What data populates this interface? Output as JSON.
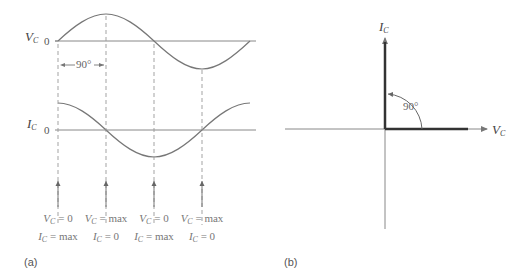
{
  "panel_a": {
    "caption": "(a)",
    "voltage_axis": {
      "symbol": "V",
      "subscript": "C",
      "zero_label": "0"
    },
    "current_axis": {
      "symbol": "I",
      "subscript": "C",
      "zero_label": "0"
    },
    "phase_annotation": "90°",
    "conditions": [
      {
        "v_label": "V",
        "v_sub": "C",
        "v_value": " = 0",
        "i_label": "I",
        "i_sub": "C",
        "i_value": " = max"
      },
      {
        "v_label": "V",
        "v_sub": "C",
        "v_value": " = max",
        "i_label": "I",
        "i_sub": "C",
        "i_value": " = 0"
      },
      {
        "v_label": "V",
        "v_sub": "C",
        "v_value": " = 0",
        "i_label": "I",
        "i_sub": "C",
        "i_value": " = max"
      },
      {
        "v_label": "V",
        "v_sub": "C",
        "v_value": " = max",
        "i_label": "I",
        "i_sub": "C",
        "i_value": " = 0"
      }
    ]
  },
  "panel_b": {
    "caption": "(b)",
    "vertical_phasor": {
      "symbol": "I",
      "subscript": "C"
    },
    "horizontal_phasor": {
      "symbol": "V",
      "subscript": "C"
    },
    "angle_label": "90°"
  },
  "colors": {
    "curve": "#777777",
    "axis": "#888888",
    "phasor": "#444444",
    "dashed": "#999999"
  }
}
